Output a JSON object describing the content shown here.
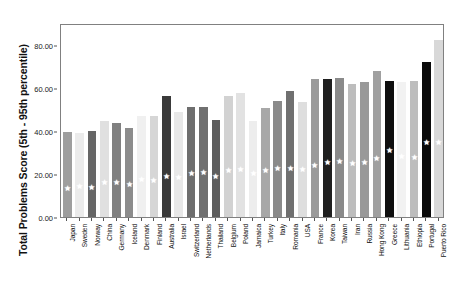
{
  "chart_data": {
    "type": "bar",
    "title": "",
    "subtitle": "",
    "xlabel": "",
    "ylabel": "Total Problems Score (5th - 95th percentile)",
    "ylim": [
      0,
      90
    ],
    "grid": false,
    "legend": null,
    "y_ticks": [
      {
        "value": 0,
        "label": "0.00"
      },
      {
        "value": 20,
        "label": "20.00"
      },
      {
        "value": 40,
        "label": "40.00"
      },
      {
        "value": 60,
        "label": "60.00"
      },
      {
        "value": 80,
        "label": "80.00"
      }
    ],
    "categories": [
      "Japan",
      "Sweden",
      "Norway",
      "China",
      "Germany",
      "Iceland",
      "Denmark",
      "Finland",
      "Australia",
      "Israel",
      "Switzerland",
      "Netherlands",
      "Thailand",
      "Belgium",
      "Poland",
      "Jamaica",
      "Turkey",
      "Italy",
      "Romania",
      "USA",
      "France",
      "Korea",
      "Taiwan",
      "Iran",
      "Russia",
      "Hong Kong",
      "Greece",
      "Lithuania",
      "Ethiopia",
      "Portugal",
      "Puerto Rico"
    ],
    "series": [
      {
        "name": "Total Problems Score (5th - 95th percentile)",
        "values": [
          39.5,
          38.8,
          39.9,
          44.4,
          43.5,
          41.5,
          46.7,
          46.8,
          56.2,
          48.7,
          51.0,
          51.0,
          44.8,
          56.0,
          57.6,
          44.6,
          50.5,
          53.9,
          58.4,
          53.2,
          63.8,
          64.2,
          64.5,
          61.9,
          62.6,
          67.6,
          63.2,
          62.8,
          63.1,
          71.8,
          82.1
        ],
        "bar_colors": [
          "#9e9e9e",
          "#ebebeb",
          "#666666",
          "#e0e0e0",
          "#808080",
          "#8c8c8c",
          "#f0f0f0",
          "#d6d6d6",
          "#3a3a3a",
          "#e8e8e8",
          "#6e6e6e",
          "#707070",
          "#5e5e5e",
          "#d2d2d2",
          "#e2e2e2",
          "#ededed",
          "#a8a8a8",
          "#8a8a8a",
          "#707070",
          "#dedede",
          "#9a9a9a",
          "#1f1f1f",
          "#8a8a8a",
          "#bdbdbd",
          "#999999",
          "#a0a0a0",
          "#0f0f0f",
          "#f2f2f2",
          "#bdbdbd",
          "#0a0a0a",
          "#d8d8d8"
        ]
      },
      {
        "name": "median marker",
        "marker": "star",
        "marker_color": "#ffffff",
        "values": [
          13.1,
          14.3,
          13.9,
          16.0,
          16.0,
          15.0,
          17.2,
          17.0,
          19.0,
          18.3,
          20.4,
          20.5,
          18.6,
          21.4,
          22.1,
          20.1,
          21.6,
          22.4,
          22.6,
          22.2,
          23.8,
          25.5,
          25.9,
          25.0,
          25.5,
          27.3,
          31.0,
          27.9,
          27.6,
          34.6,
          34.4
        ]
      }
    ]
  }
}
